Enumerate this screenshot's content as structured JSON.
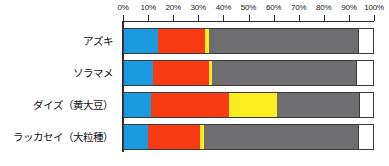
{
  "chart_data": {
    "type": "bar",
    "orientation": "horizontal",
    "stacked": true,
    "stack_unit": "percent",
    "title": "",
    "subtitle": "",
    "xlabel": "",
    "ylabel": "",
    "xlim": [
      0,
      100
    ],
    "grid": false,
    "legend": "none",
    "axis_position": "top",
    "tick_labels": [
      "0%",
      "10%",
      "20%",
      "30%",
      "40%",
      "50%",
      "60%",
      "70%",
      "80%",
      "90%",
      "100%"
    ],
    "tick_values": [
      0,
      10,
      20,
      30,
      40,
      50,
      60,
      70,
      80,
      90,
      100
    ],
    "categories": [
      "アズキ",
      "ソラマメ",
      "ダイズ（黄大豆）",
      "ラッカセイ（大粒種）"
    ],
    "series": [
      {
        "name": "blue-segment",
        "color": "#1b9ae0",
        "values": [
          13.5,
          11.5,
          11.0,
          9.5
        ]
      },
      {
        "name": "red-segment",
        "color": "#f93b14",
        "values": [
          19.0,
          22.5,
          31.0,
          21.0
        ]
      },
      {
        "name": "yellow-segment",
        "color": "#fbed20",
        "values": [
          1.5,
          1.5,
          19.5,
          1.5
        ]
      },
      {
        "name": "gray-segment",
        "color": "#6e6e70",
        "values": [
          60.0,
          57.5,
          33.0,
          62.0
        ]
      },
      {
        "name": "white-segment",
        "color": "#ffffff",
        "values": [
          6.0,
          7.0,
          5.5,
          6.0
        ]
      }
    ],
    "colors": {
      "blue": "#1b9ae0",
      "red": "#f93b14",
      "yellow": "#fbed20",
      "gray": "#6e6e70",
      "white": "#ffffff",
      "axis": "#2a2a2a",
      "border": "#3a3a3a",
      "text": "#111111",
      "background": "#ffffff"
    }
  }
}
